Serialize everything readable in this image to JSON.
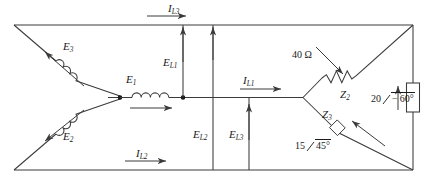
{
  "diagram": {
    "line_color": "#3a3a3a",
    "text_color": "#1a1a1a"
  },
  "source": {
    "type": "wye-connected-source",
    "coils": [
      {
        "id": "E1",
        "base": "E",
        "sub": "1",
        "orientation": "horizontal",
        "arrow": "right"
      },
      {
        "id": "E2",
        "base": "E",
        "sub": "2",
        "orientation": "diagonal-down-left",
        "arrow": "down-left"
      },
      {
        "id": "E3",
        "base": "E",
        "sub": "3",
        "orientation": "diagonal-up-left",
        "arrow": "up-left"
      }
    ]
  },
  "line_currents": [
    {
      "id": "IL1",
      "base": "I",
      "sub": "L1",
      "arrow": "right",
      "location": "middle-rail"
    },
    {
      "id": "IL2",
      "base": "I",
      "sub": "L2",
      "arrow": "right",
      "location": "bottom-rail"
    },
    {
      "id": "IL3",
      "base": "I",
      "sub": "L3",
      "arrow": "right",
      "location": "top-rail"
    }
  ],
  "line_voltages": [
    {
      "id": "EL1",
      "base": "E",
      "sub": "L1",
      "arrow": "up",
      "location": "upper-vertical"
    },
    {
      "id": "EL2",
      "base": "E",
      "sub": "L2",
      "arrow": "up",
      "location": "center-vertical"
    },
    {
      "id": "EL3",
      "base": "E",
      "sub": "L3",
      "arrow": "up",
      "location": "lower-vertical"
    }
  ],
  "load": {
    "type": "wye-connected-load",
    "branches": [
      {
        "id": "Z1",
        "symbol": "resistor",
        "value_label": "40 Ω",
        "position": "upper-diagonal",
        "arrow": "down-right"
      },
      {
        "id": "Z2",
        "base": "Z",
        "sub": "2",
        "symbol": "impedance-box",
        "value_label": "20",
        "angle_label": "− 60°",
        "magnitude": 20,
        "angle_deg": -60,
        "position": "right-vertical",
        "arrow": "up"
      },
      {
        "id": "Z3",
        "base": "Z",
        "sub": "3",
        "symbol": "impedance",
        "value_label": "15",
        "angle_label": "45°",
        "magnitude": 15,
        "angle_deg": 45,
        "position": "lower-diagonal",
        "arrow": "up-right"
      }
    ]
  }
}
